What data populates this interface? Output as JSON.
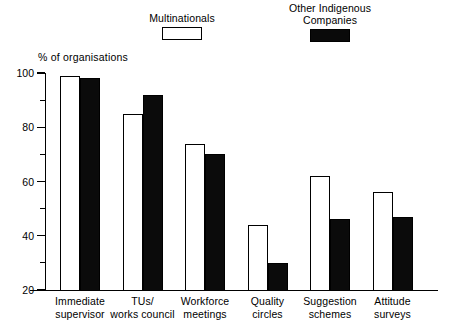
{
  "chart_data": {
    "type": "bar",
    "title": "",
    "subtitle": "",
    "xlabel": "",
    "ylabel": "% of organisations",
    "ylim": [
      20,
      100
    ],
    "y_ticks_major": [
      20,
      40,
      60,
      80,
      100
    ],
    "y_ticks_minor": [
      30,
      50,
      70,
      90
    ],
    "grid": false,
    "legend_position": "top",
    "categories": [
      "Immediate\nsupervisor",
      "TUs/\nworks council",
      "Workforce\nmeetings",
      "Quality\ncircles",
      "Suggestion\nschemes",
      "Attitude\nsurveys"
    ],
    "series": [
      {
        "name": "Multinationals",
        "style": "open",
        "color": "#ffffff",
        "values": [
          99,
          85,
          74,
          44,
          62,
          56
        ]
      },
      {
        "name": "Other Indigenous\nCompanies",
        "style": "filled",
        "color": "#000000",
        "values": [
          98,
          92,
          70,
          30,
          46,
          47
        ]
      }
    ]
  },
  "legend": {
    "entries": [
      {
        "label": "Multinationals",
        "swatch": "open-square-swatch"
      },
      {
        "label": "Other Indigenous\nCompanies",
        "swatch": "filled-square-swatch"
      }
    ]
  },
  "axis": {
    "y_title": "% of organisations",
    "y_tick_labels": [
      "100",
      "80",
      "60",
      "40",
      "20"
    ]
  }
}
